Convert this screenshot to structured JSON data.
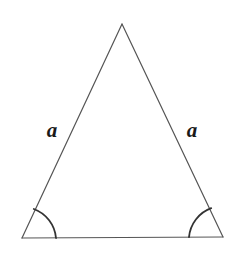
{
  "figure": {
    "kind": "geometry-diagram",
    "shape": "isosceles-triangle",
    "width": 231,
    "height": 258,
    "background_color": "#ffffff",
    "stroke_color": "#555555",
    "arc_color": "#333333",
    "label_color": "#1a1a1a",
    "side_stroke_width": 1.2,
    "arc_stroke_width": 1.8
  },
  "vertices": {
    "apex": {
      "name": "apex",
      "x": 122,
      "y": 24
    },
    "bottom_left": {
      "name": "bottom-left",
      "x": 22,
      "y": 238
    },
    "bottom_right": {
      "name": "bottom-right",
      "x": 223,
      "y": 237
    }
  },
  "edges": [
    {
      "name": "left-side",
      "from": "apex",
      "to": "bottom_left",
      "label": "a"
    },
    {
      "name": "right-side",
      "from": "apex",
      "to": "bottom_right",
      "label": "a"
    },
    {
      "name": "base",
      "from": "bottom_left",
      "to": "bottom_right",
      "label": ""
    }
  ],
  "labels": {
    "left_side": {
      "text": "a",
      "x": 52,
      "y": 130
    },
    "right_side": {
      "text": "a",
      "x": 192,
      "y": 130
    }
  },
  "angle_marks": [
    {
      "name": "left-base-angle-arc",
      "vertex": "bottom_left",
      "radius": 34,
      "start_x": 33,
      "start_y": 207,
      "end_x": 56,
      "end_y": 238
    },
    {
      "name": "right-base-angle-arc",
      "vertex": "bottom_right",
      "radius": 34,
      "start_x": 212,
      "start_y": 207,
      "end_x": 189,
      "end_y": 238
    }
  ],
  "paths": {
    "left_side": "M 122 24 L 22 238",
    "right_side": "M 122 24 L 223 237",
    "base": "M 22 238 L 223 237",
    "left_arc": "M 33.8 209.0 A 34 34 0 0 1 56 238",
    "right_arc": "M 211.2 208.2 A 34 34 0 0 0 189 237.2"
  }
}
